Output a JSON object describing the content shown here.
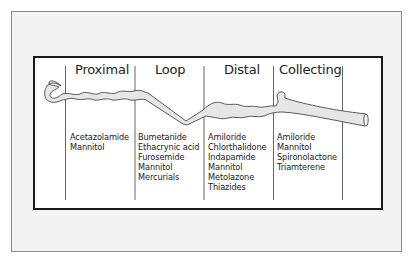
{
  "diagram": {
    "segments": [
      {
        "name": "Proximal",
        "drugs": [
          "Acetazolamide",
          "Mannitol"
        ]
      },
      {
        "name": "Loop",
        "drugs": [
          "Bumetanide",
          "Ethacrynic acid",
          "Furosemide",
          "Mannitol",
          "Mercurials"
        ]
      },
      {
        "name": "Distal",
        "drugs": [
          "Amiloride",
          "Chlorthalidone",
          "Indapamide",
          "Mannitol",
          "Metolazone",
          "Thiazides"
        ]
      },
      {
        "name": "Collecting",
        "drugs": [
          "Amiloride",
          "Mannitol",
          "Spironolactone",
          "Triamterene"
        ]
      }
    ],
    "colors": {
      "frame_bg": "#f3f3f3",
      "frame_border": "#8a8a8a",
      "panel_bg": "#ffffff",
      "panel_border": "#1a1a1a",
      "tubule_fill": "#e6e6e6",
      "tubule_stroke": "#333333",
      "text": "#222222"
    }
  }
}
